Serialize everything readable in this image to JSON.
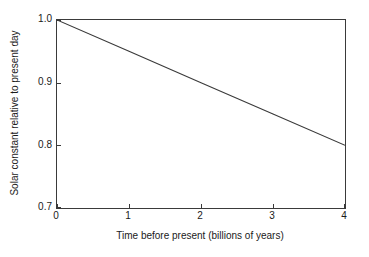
{
  "chart_data": {
    "type": "line",
    "title": "",
    "xlabel": "Time before present (billions of years)",
    "ylabel": "Solar constant relative to present day",
    "xlim": [
      0,
      4
    ],
    "ylim": [
      0.7,
      1.0
    ],
    "xticks": [
      "0",
      "1",
      "2",
      "3",
      "4"
    ],
    "xtick_values": [
      0,
      1,
      2,
      3,
      4
    ],
    "yticks": [
      "1.0",
      "0.9",
      "0.8",
      "0.7"
    ],
    "ytick_values": [
      1.0,
      0.9,
      0.8,
      0.7
    ],
    "grid": false,
    "legend": "none",
    "frame": "box",
    "tick_direction": "in",
    "series": [
      {
        "name": "Solar constant",
        "color": "#3a3a3a",
        "x": [
          0,
          1,
          2,
          3,
          4
        ],
        "y": [
          1.0,
          0.95,
          0.9,
          0.85,
          0.8
        ]
      }
    ]
  },
  "axes": {
    "x_title": "Time before present (billions of years)",
    "y_title": "Solar constant relative to present day"
  },
  "colors": {
    "line": "#3a3a3a",
    "frame": "#3a3a3a",
    "text": "#1a1a1a",
    "background": "#ffffff"
  }
}
